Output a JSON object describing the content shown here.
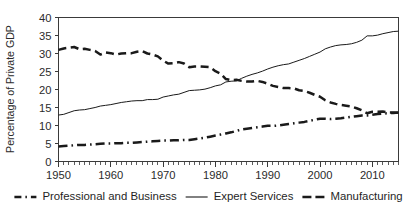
{
  "chart_data": {
    "type": "line",
    "title": "",
    "xlabel": "",
    "ylabel": "Percentage of Private GDP",
    "xlim": [
      1950,
      2015
    ],
    "ylim": [
      0,
      40
    ],
    "ytick_step": 5,
    "xtick_step": 10,
    "minor_xticks": "every 1 year",
    "grid": false,
    "legend_position": "bottom",
    "yticks": [
      "0",
      "5",
      "10",
      "15",
      "20",
      "25",
      "30",
      "35",
      "40"
    ],
    "xticks": [
      "1950",
      "1960",
      "1970",
      "1980",
      "1990",
      "2000",
      "2010"
    ],
    "x": [
      1950,
      1951,
      1952,
      1953,
      1954,
      1955,
      1956,
      1957,
      1958,
      1959,
      1960,
      1961,
      1962,
      1963,
      1964,
      1965,
      1966,
      1967,
      1968,
      1969,
      1970,
      1971,
      1972,
      1973,
      1974,
      1975,
      1976,
      1977,
      1978,
      1979,
      1980,
      1981,
      1982,
      1983,
      1984,
      1985,
      1986,
      1987,
      1988,
      1989,
      1990,
      1991,
      1992,
      1993,
      1994,
      1995,
      1996,
      1997,
      1998,
      1999,
      2000,
      2001,
      2002,
      2003,
      2004,
      2005,
      2006,
      2007,
      2008,
      2009,
      2010,
      2011,
      2012,
      2013,
      2014,
      2015
    ],
    "series": [
      {
        "name": "Professional and Business",
        "style": "dash-dot",
        "linewidth": "thick",
        "color": "#1a1a1a",
        "values": [
          4.2,
          4.3,
          4.4,
          4.5,
          4.6,
          4.6,
          4.7,
          4.8,
          4.9,
          5.0,
          5.0,
          5.1,
          5.1,
          5.2,
          5.2,
          5.3,
          5.4,
          5.5,
          5.6,
          5.7,
          5.8,
          5.8,
          5.9,
          5.9,
          6.0,
          6.0,
          6.2,
          6.4,
          6.6,
          6.9,
          7.2,
          7.5,
          7.8,
          8.1,
          8.5,
          8.9,
          9.1,
          9.3,
          9.5,
          9.7,
          9.9,
          9.9,
          10.0,
          10.2,
          10.4,
          10.6,
          10.8,
          11.0,
          11.3,
          11.6,
          11.9,
          11.9,
          11.8,
          11.9,
          12.0,
          12.2,
          12.4,
          12.6,
          12.8,
          12.8,
          13.0,
          13.2,
          13.3,
          13.4,
          13.5,
          13.6
        ]
      },
      {
        "name": "Expert Services",
        "style": "solid",
        "linewidth": "thin",
        "color": "#404040",
        "values": [
          12.9,
          13.1,
          13.6,
          14.1,
          14.3,
          14.4,
          14.7,
          15.0,
          15.4,
          15.6,
          15.8,
          16.1,
          16.4,
          16.6,
          16.8,
          16.9,
          16.9,
          17.2,
          17.2,
          17.3,
          17.9,
          18.2,
          18.5,
          18.7,
          19.2,
          19.7,
          19.8,
          19.9,
          20.1,
          20.5,
          21.0,
          21.3,
          22.1,
          22.3,
          22.4,
          23.1,
          23.7,
          24.2,
          24.6,
          25.1,
          25.7,
          26.2,
          26.6,
          26.9,
          27.1,
          27.6,
          28.1,
          28.6,
          29.2,
          29.8,
          30.4,
          31.3,
          31.8,
          32.2,
          32.4,
          32.5,
          32.7,
          33.1,
          33.7,
          34.9,
          34.9,
          35.1,
          35.5,
          35.8,
          36.1,
          36.2
        ]
      },
      {
        "name": "Manufacturing",
        "style": "dashed",
        "linewidth": "thick",
        "color": "#1a1a1a",
        "values": [
          31.0,
          31.4,
          31.6,
          31.8,
          31.2,
          31.3,
          31.0,
          30.7,
          29.7,
          30.3,
          30.1,
          29.7,
          30.0,
          30.1,
          30.1,
          30.5,
          30.7,
          30.0,
          29.7,
          29.2,
          28.0,
          27.2,
          27.3,
          27.6,
          27.2,
          26.2,
          26.4,
          26.4,
          26.3,
          26.2,
          25.1,
          24.4,
          22.9,
          22.6,
          22.7,
          22.4,
          22.2,
          22.2,
          22.4,
          22.1,
          21.6,
          21.0,
          20.7,
          20.4,
          20.4,
          20.3,
          19.8,
          19.6,
          19.1,
          18.5,
          18.0,
          17.0,
          16.4,
          16.0,
          15.7,
          15.5,
          15.3,
          14.8,
          14.2,
          13.4,
          13.8,
          13.8,
          13.9,
          13.6,
          13.6,
          13.5
        ]
      }
    ]
  },
  "legend": {
    "items": [
      {
        "label": "Professional and Business",
        "marker": "dash-dot-line-icon"
      },
      {
        "label": "Expert Services",
        "marker": "solid-line-icon"
      },
      {
        "label": "Manufacturing",
        "marker": "dashed-line-icon"
      }
    ]
  }
}
